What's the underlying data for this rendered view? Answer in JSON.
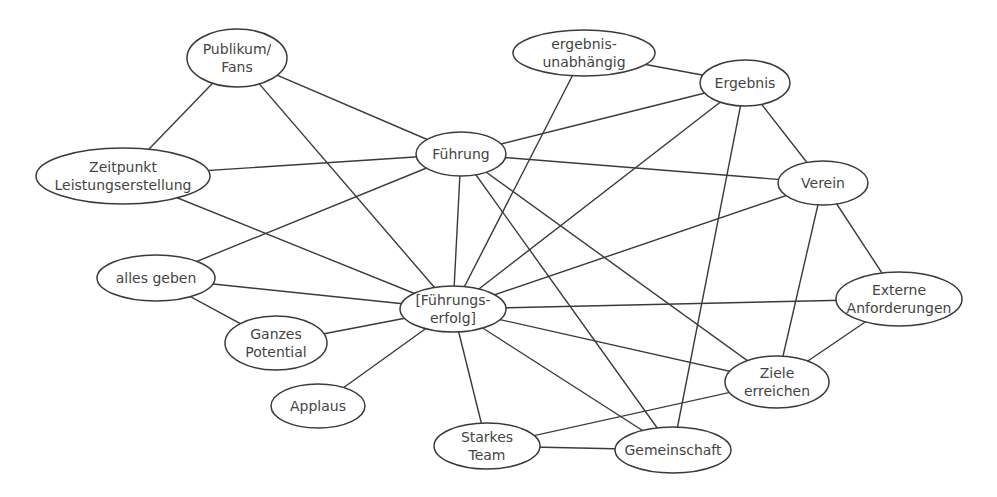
{
  "diagram": {
    "type": "concept-network",
    "nodes": [
      {
        "id": "publikum",
        "lines": [
          "Publikum/",
          "Fans"
        ],
        "cx": 237,
        "cy": 58,
        "rx": 50,
        "ry": 29
      },
      {
        "id": "zeitpunkt",
        "lines": [
          "Zeitpunkt",
          "Leistungserstellung"
        ],
        "cx": 123,
        "cy": 176,
        "rx": 87,
        "ry": 28
      },
      {
        "id": "fuehrung",
        "lines": [
          "Führung"
        ],
        "cx": 461,
        "cy": 154,
        "rx": 45,
        "ry": 22
      },
      {
        "id": "ergebnisunabhaengig",
        "lines": [
          "ergebnis-",
          "unabhängig"
        ],
        "cx": 584,
        "cy": 53,
        "rx": 71,
        "ry": 23
      },
      {
        "id": "ergebnis",
        "lines": [
          "Ergebnis"
        ],
        "cx": 745,
        "cy": 83,
        "rx": 45,
        "ry": 23
      },
      {
        "id": "verein",
        "lines": [
          "Verein"
        ],
        "cx": 823,
        "cy": 183,
        "rx": 45,
        "ry": 22
      },
      {
        "id": "allesgeben",
        "lines": [
          "alles geben"
        ],
        "cx": 156,
        "cy": 278,
        "rx": 59,
        "ry": 23
      },
      {
        "id": "fuehrungserfolg",
        "lines": [
          "[Führungs-",
          "erfolg]"
        ],
        "cx": 453,
        "cy": 309,
        "rx": 53,
        "ry": 23
      },
      {
        "id": "externe",
        "lines": [
          "Externe",
          "Anforderungen"
        ],
        "cx": 899,
        "cy": 299,
        "rx": 63,
        "ry": 27
      },
      {
        "id": "ganzes",
        "lines": [
          "Ganzes",
          "Potential"
        ],
        "cx": 276,
        "cy": 343,
        "rx": 51,
        "ry": 27
      },
      {
        "id": "applaus",
        "lines": [
          "Applaus"
        ],
        "cx": 318,
        "cy": 406,
        "rx": 47,
        "ry": 22
      },
      {
        "id": "ziele",
        "lines": [
          "Ziele",
          "erreichen"
        ],
        "cx": 777,
        "cy": 382,
        "rx": 52,
        "ry": 26
      },
      {
        "id": "starkes",
        "lines": [
          "Starkes",
          "Team"
        ],
        "cx": 487,
        "cy": 446,
        "rx": 53,
        "ry": 23
      },
      {
        "id": "gemeinschaft",
        "lines": [
          "Gemeinschaft"
        ],
        "cx": 673,
        "cy": 450,
        "rx": 58,
        "ry": 23
      }
    ],
    "edges": [
      [
        "publikum",
        "zeitpunkt"
      ],
      [
        "publikum",
        "fuehrung"
      ],
      [
        "publikum",
        "fuehrungserfolg"
      ],
      [
        "zeitpunkt",
        "fuehrung"
      ],
      [
        "zeitpunkt",
        "fuehrungserfolg"
      ],
      [
        "ergebnisunabhaengig",
        "ergebnis"
      ],
      [
        "ergebnisunabhaengig",
        "fuehrungserfolg"
      ],
      [
        "ergebnis",
        "fuehrung"
      ],
      [
        "ergebnis",
        "fuehrungserfolg"
      ],
      [
        "ergebnis",
        "verein"
      ],
      [
        "ergebnis",
        "gemeinschaft"
      ],
      [
        "fuehrung",
        "verein"
      ],
      [
        "fuehrung",
        "allesgeben"
      ],
      [
        "fuehrung",
        "fuehrungserfolg"
      ],
      [
        "fuehrung",
        "gemeinschaft"
      ],
      [
        "fuehrung",
        "ziele"
      ],
      [
        "verein",
        "fuehrungserfolg"
      ],
      [
        "verein",
        "externe"
      ],
      [
        "verein",
        "ziele"
      ],
      [
        "allesgeben",
        "fuehrungserfolg"
      ],
      [
        "allesgeben",
        "ganzes"
      ],
      [
        "ganzes",
        "fuehrungserfolg"
      ],
      [
        "applaus",
        "fuehrungserfolg"
      ],
      [
        "fuehrungserfolg",
        "externe"
      ],
      [
        "fuehrungserfolg",
        "ziele"
      ],
      [
        "fuehrungserfolg",
        "starkes"
      ],
      [
        "fuehrungserfolg",
        "gemeinschaft"
      ],
      [
        "externe",
        "ziele"
      ],
      [
        "ziele",
        "starkes"
      ],
      [
        "starkes",
        "gemeinschaft"
      ]
    ]
  }
}
